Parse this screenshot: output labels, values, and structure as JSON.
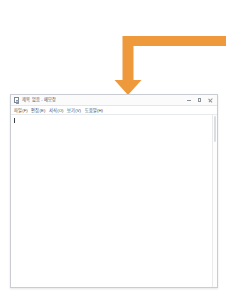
{
  "page": {
    "background_color": "#ffffff"
  },
  "annotation": {
    "name": "orange-elbow-arrow",
    "color": "#ef993d",
    "direction": "right-to-left-then-down",
    "points_to": "application-window-title-bar"
  },
  "window": {
    "title": "제목 없음 - 메모장",
    "title_icon": "document-icon",
    "controls": {
      "minimize_label": "—",
      "maximize_label": "□",
      "close_label": "✕"
    },
    "menu": {
      "items": [
        {
          "label": "파일(F)"
        },
        {
          "label": "편집(E)"
        },
        {
          "label": "서식(O)"
        },
        {
          "label": "보기(V)"
        },
        {
          "label": "도움말(H)"
        }
      ]
    },
    "document": {
      "content": "",
      "placeholder": ""
    },
    "scrollbar": {
      "orientation": "vertical",
      "thumb_position": "top"
    }
  }
}
